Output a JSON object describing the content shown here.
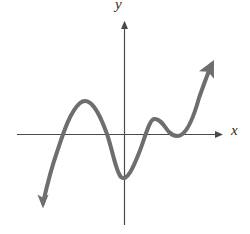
{
  "figure": {
    "type": "math-graph",
    "background_color": "#ffffff",
    "width": 250,
    "height": 234
  },
  "axes": {
    "color": "#4a4a4a",
    "line_width": 1.2,
    "x_axis": {
      "label": "x",
      "label_icon": "x-axis-label",
      "y_pixel": 134,
      "x_start_pixel": 17,
      "x_end_pixel": 225,
      "arrow": "right"
    },
    "y_axis": {
      "label": "y",
      "label_icon": "y-axis-label",
      "x_pixel": 124,
      "y_start_pixel": 225,
      "y_end_pixel": 18,
      "arrow": "up"
    }
  },
  "chart_data": {
    "type": "line",
    "title": "",
    "xlabel": "x",
    "ylabel": "y",
    "grid": false,
    "legend": null,
    "curve_color": "#6e6e6e",
    "curve_width": 4,
    "x_intercepts_pixels": [
      57,
      104,
      139,
      162,
      179
    ],
    "turning_points_pixels": [
      {
        "name": "local-maximum-1",
        "x": 80,
        "y": 102
      },
      {
        "name": "local-minimum-1",
        "x": 120,
        "y": 177
      },
      {
        "name": "local-maximum-2",
        "x": 152,
        "y": 118
      },
      {
        "name": "local-minimum-2",
        "x": 178,
        "y": 136
      }
    ],
    "endpoints_pixels": [
      {
        "name": "arrow-down-left",
        "x": 43,
        "y": 207
      },
      {
        "name": "arrow-up-right",
        "x": 213,
        "y": 60
      }
    ],
    "path": "M 43 203 C 46 190 50 172 57 152 C 64 131 70 112 80 103 C 90 95 99 112 107 134 C 113 152 116 172 121 177 C 127 182 133 168 139 153 C 145 138 149 120 154 119 C 160 118 164 126 169 132 C 173 136 177 137 181 135 C 188 131 194 116 199 98 C 205 81 209 70 212 64"
  }
}
